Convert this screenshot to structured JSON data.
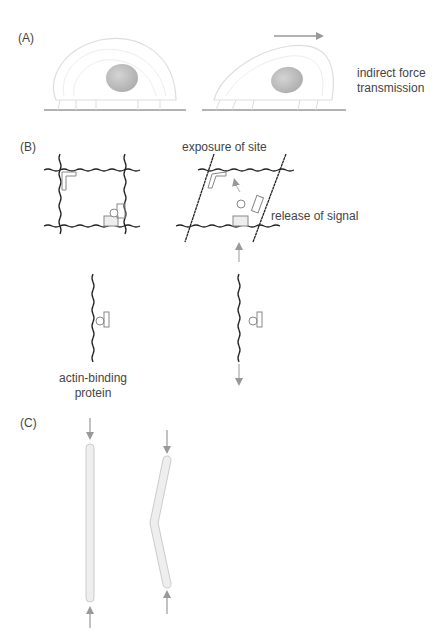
{
  "panels": {
    "a": {
      "label": "(A)",
      "caption_line1": "indirect force",
      "caption_line2": "transmission"
    },
    "b": {
      "label": "(B)",
      "exposure": "exposure of site",
      "release": "release of signal",
      "protein_line1": "actin-binding",
      "protein_line2": "protein"
    },
    "c": {
      "label": "(C)"
    }
  },
  "colors": {
    "line": "#222222",
    "gray": "#999999",
    "light": "#d8d8d8",
    "nucleus": "#bdbdbd",
    "rod": "#ececec"
  }
}
